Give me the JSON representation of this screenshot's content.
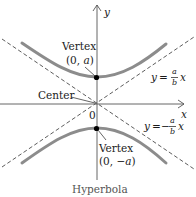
{
  "figure": {
    "caption": "Hyperbola",
    "axes": {
      "x_label": "x",
      "y_label": "y",
      "origin_label": "0"
    },
    "labels": {
      "center": "Center",
      "upper_vertex_title": "Vertex",
      "upper_vertex_coords_open": "(0, ",
      "upper_vertex_coords_var": "a",
      "upper_vertex_coords_close": ")",
      "lower_vertex_title": "Vertex",
      "lower_vertex_coords_open": "(0, ",
      "lower_vertex_coords_neg": "−",
      "lower_vertex_coords_var": "a",
      "lower_vertex_coords_close": ")"
    },
    "asymptotes": {
      "positive": {
        "lhs": "y",
        "eq": "=",
        "num": "a",
        "den": "b",
        "rhs": "x"
      },
      "negative": {
        "lhs": "y",
        "eq": "=",
        "neg": "−",
        "num": "a",
        "den": "b",
        "rhs": "x"
      }
    },
    "colors": {
      "curve": "#8c8c8c",
      "axis": "#555555",
      "asymptote": "#333333",
      "vertex_dot": "#000000"
    }
  }
}
